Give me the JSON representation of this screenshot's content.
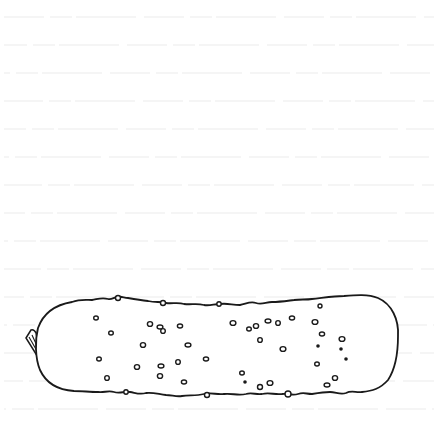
{
  "image": {
    "subject": "pickle line drawing",
    "background": "lined paper",
    "colors": {
      "background": "#ffffff",
      "rule_lines": "#ececec",
      "ink": "#1a1a1a"
    },
    "rule_lines_y": [
      17,
      45,
      73,
      101,
      129,
      157,
      185,
      213,
      241,
      269,
      297,
      325,
      353,
      381,
      409
    ],
    "pickle": {
      "bounds": {
        "x": 22,
        "y": 295,
        "width": 378,
        "height": 103
      },
      "bumps": [
        [
          96,
          318
        ],
        [
          150,
          324
        ],
        [
          160,
          327
        ],
        [
          163,
          331
        ],
        [
          180,
          326
        ],
        [
          233,
          323
        ],
        [
          249,
          329
        ],
        [
          256,
          326
        ],
        [
          268,
          321
        ],
        [
          278,
          323
        ],
        [
          292,
          318
        ],
        [
          315,
          322
        ],
        [
          111,
          333
        ],
        [
          143,
          345
        ],
        [
          188,
          345
        ],
        [
          260,
          340
        ],
        [
          322,
          334
        ],
        [
          342,
          339
        ],
        [
          99,
          359
        ],
        [
          137,
          367
        ],
        [
          161,
          366
        ],
        [
          178,
          362
        ],
        [
          206,
          359
        ],
        [
          283,
          349
        ],
        [
          317,
          364
        ],
        [
          335,
          378
        ],
        [
          327,
          385
        ],
        [
          107,
          378
        ],
        [
          184,
          382
        ],
        [
          270,
          383
        ],
        [
          242,
          373
        ],
        [
          160,
          376
        ]
      ],
      "filled_dots": [
        [
          126,
          392
        ],
        [
          341,
          349
        ],
        [
          318,
          346
        ],
        [
          346,
          359
        ],
        [
          245,
          382
        ]
      ]
    }
  }
}
